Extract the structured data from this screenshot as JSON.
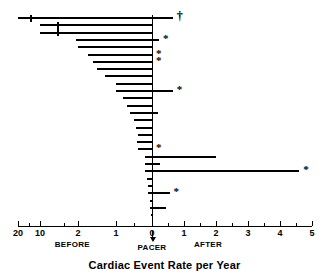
{
  "figure": {
    "caption": "Cardiac Event Rate per Year",
    "width": 329,
    "height": 276
  },
  "chart_data": {
    "type": "bar",
    "orientation": "horizontal",
    "title": "",
    "xlabel": "Cardiac Event Rate per Year",
    "ylabel": "",
    "grid": false,
    "legend_position": "none",
    "axis": {
      "tick_labels": [
        "20",
        "10",
        "2",
        "1",
        "0",
        "1",
        "2",
        "3",
        "4",
        "5"
      ],
      "tick_values": [
        -20,
        -10,
        -2,
        -1,
        0,
        1,
        2,
        3,
        4,
        5
      ],
      "minor_tick_values": [
        -15,
        -5,
        -0.5,
        0.5,
        1.5,
        2.5,
        3.5,
        4.5
      ],
      "note": "left (BEFORE) side uses a compressed / broken scale; right (AFTER) side is linear 0 to 5",
      "group_labels": [
        "BEFORE",
        "PACER",
        "AFTER"
      ]
    },
    "markers": {
      "star": "*",
      "dagger": "†"
    },
    "categories": [
      "patient-1",
      "patient-2",
      "patient-3",
      "patient-4",
      "patient-5",
      "patient-6",
      "patient-7",
      "patient-8",
      "patient-9",
      "patient-10",
      "patient-11",
      "patient-12",
      "patient-13",
      "patient-14",
      "patient-15",
      "patient-16",
      "patient-17",
      "patient-18",
      "patient-19",
      "patient-20",
      "patient-21",
      "patient-22",
      "patient-23",
      "patient-24",
      "patient-25",
      "patient-26"
    ],
    "bars": [
      {
        "id": "patient-1",
        "before": 20.0,
        "after": 0.65,
        "marker": "dagger",
        "break_at": -14.5
      },
      {
        "id": "patient-2",
        "before": 10.0,
        "after": 0.0,
        "marker": "",
        "break_at": -6.5
      },
      {
        "id": "patient-3",
        "before": 10.0,
        "after": 0.0,
        "marker": "",
        "break_at": -6.5
      },
      {
        "id": "patient-4",
        "before": 2.5,
        "after": 0.22,
        "marker": "star",
        "break_at": null
      },
      {
        "id": "patient-5",
        "before": 2.1,
        "after": 0.0,
        "marker": "",
        "break_at": null
      },
      {
        "id": "patient-6",
        "before": 1.75,
        "after": 0.0,
        "marker": "star",
        "break_at": null
      },
      {
        "id": "patient-7",
        "before": 1.6,
        "after": 0.0,
        "marker": "star",
        "break_at": null
      },
      {
        "id": "patient-8",
        "before": 1.5,
        "after": 0.0,
        "marker": "",
        "break_at": null
      },
      {
        "id": "patient-9",
        "before": 1.3,
        "after": 0.0,
        "marker": "",
        "break_at": null
      },
      {
        "id": "patient-10",
        "before": 1.0,
        "after": 0.0,
        "marker": "",
        "break_at": null
      },
      {
        "id": "patient-11",
        "before": 1.0,
        "after": 0.65,
        "marker": "star",
        "break_at": null
      },
      {
        "id": "patient-12",
        "before": 0.8,
        "after": 0.0,
        "marker": "",
        "break_at": null
      },
      {
        "id": "patient-13",
        "before": 0.7,
        "after": 0.0,
        "marker": "",
        "break_at": null
      },
      {
        "id": "patient-14",
        "before": 0.6,
        "after": 0.18,
        "marker": "",
        "break_at": null
      },
      {
        "id": "patient-15",
        "before": 0.5,
        "after": 0.0,
        "marker": "",
        "break_at": null
      },
      {
        "id": "patient-16",
        "before": 0.45,
        "after": 0.0,
        "marker": "",
        "break_at": null
      },
      {
        "id": "patient-17",
        "before": 0.4,
        "after": 0.0,
        "marker": "",
        "break_at": null
      },
      {
        "id": "patient-18",
        "before": 0.42,
        "after": 0.0,
        "marker": "",
        "break_at": null
      },
      {
        "id": "patient-19",
        "before": 0.4,
        "after": 0.0,
        "marker": "star",
        "break_at": null
      },
      {
        "id": "patient-20",
        "before": 0.2,
        "after": 2.0,
        "marker": "",
        "break_at": null
      },
      {
        "id": "patient-21",
        "before": 0.2,
        "after": 0.25,
        "marker": "",
        "break_at": null
      },
      {
        "id": "patient-22",
        "before": 0.2,
        "after": 4.6,
        "marker": "star",
        "break_at": null
      },
      {
        "id": "patient-23",
        "before": 0.15,
        "after": 0.0,
        "marker": "",
        "break_at": null
      },
      {
        "id": "patient-24",
        "before": 0.12,
        "after": 0.0,
        "marker": "",
        "break_at": null
      },
      {
        "id": "patient-25",
        "before": 0.1,
        "after": 0.55,
        "marker": "star",
        "break_at": null
      },
      {
        "id": "patient-26",
        "before": 0.05,
        "after": 0.0,
        "marker": "",
        "break_at": null
      },
      {
        "id": "patient-27",
        "before": 0.06,
        "after": 0.45,
        "marker": "",
        "break_at": null
      },
      {
        "id": "patient-28",
        "before": 0.04,
        "after": 0.0,
        "marker": "",
        "break_at": null
      }
    ]
  }
}
